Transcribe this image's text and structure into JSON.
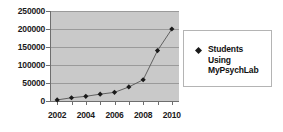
{
  "chart_data": {
    "type": "line",
    "title": "",
    "subtitle": "",
    "xlabel": "",
    "ylabel": "",
    "x": [
      2002,
      2003,
      2004,
      2005,
      2006,
      2007,
      2008,
      2009,
      2010
    ],
    "categories": [
      "2002",
      "2003",
      "2004",
      "2005",
      "2006",
      "2007",
      "2008",
      "2009",
      "2010"
    ],
    "series": [
      {
        "name": "Students Using MyPsychLab",
        "values": [
          3000,
          9000,
          13000,
          19000,
          24000,
          39000,
          59000,
          140000,
          200000
        ],
        "marker": "diamond",
        "color": "#1a1a1a"
      }
    ],
    "ylim": [
      0,
      250000
    ],
    "xlim": [
      2001.5,
      2010.5
    ],
    "yticks": [
      0,
      50000,
      100000,
      150000,
      200000,
      250000
    ],
    "ytick_labels": [
      "0",
      "50000",
      "100000",
      "150000",
      "200000",
      "250000"
    ],
    "xticks": [
      2002,
      2003,
      2004,
      2005,
      2006,
      2007,
      2008,
      2009,
      2010
    ],
    "xtick_labels": [
      "2002",
      "",
      "2004",
      "",
      "2006",
      "",
      "2008",
      "",
      "2010"
    ],
    "xtick_labels_visible": [
      "2002",
      "2004",
      "2006",
      "2008",
      "2010"
    ],
    "grid": true,
    "grid_axis": "y",
    "legend_position": "right",
    "plot_background": "#c9c9c9",
    "figure_background": "#ffffff",
    "gridline_color": "#9a9a9a",
    "axis_color": "#6e6e6e"
  },
  "legend": {
    "entries": [
      {
        "marker_name": "diamond-marker",
        "lines": [
          "Students",
          "Using",
          "MyPsychLab"
        ],
        "full_label": "Students Using MyPsychLab"
      }
    ]
  }
}
